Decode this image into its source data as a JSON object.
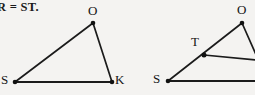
{
  "figure": {
    "background_color": "#f4f3f1",
    "stroke_color": "#1b1b1b",
    "text_color": "#141414",
    "caption": {
      "equation_fragment": "R = ST."
    },
    "left_triangle": {
      "name": "triangle-sok",
      "vertices": [
        {
          "label": "S",
          "x": 15,
          "y": 82,
          "label_x": 1,
          "label_y": 74
        },
        {
          "label": "O",
          "x": 93,
          "y": 23,
          "label_x": 89,
          "label_y": 6
        },
        {
          "label": "K",
          "x": 112,
          "y": 82,
          "label_x": 116,
          "label_y": 74
        }
      ],
      "edges": [
        {
          "name": "edge-s-o",
          "from": "S",
          "to": "O",
          "width": 1.7
        },
        {
          "name": "edge-o-k",
          "from": "O",
          "to": "K",
          "width": 1.7
        },
        {
          "name": "edge-s-k",
          "from": "S",
          "to": "K",
          "width": 2.2
        }
      ]
    },
    "right_figure": {
      "name": "figure-sto",
      "vertices": [
        {
          "label": "S",
          "x": 168,
          "y": 81,
          "label_x": 154,
          "label_y": 73
        },
        {
          "label": "T",
          "x": 204,
          "y": 55,
          "label_x": 192,
          "label_y": 36
        },
        {
          "label": "O",
          "x": 242,
          "y": 23,
          "label_x": 238,
          "label_y": 5
        },
        {
          "label": "",
          "x": 256,
          "y": 57,
          "label_x": 0,
          "label_y": 0
        }
      ],
      "edges": [
        {
          "name": "edge-s-t-o",
          "from": "S",
          "to": "O",
          "width": 1.7
        },
        {
          "name": "edge-o-right",
          "from": "O",
          "to": "R",
          "width": 1.7
        },
        {
          "name": "edge-t-right",
          "from": "T",
          "to": "R",
          "width": 1.7
        },
        {
          "name": "edge-s-baseline",
          "from": "S",
          "to": "RB",
          "width": 2.2
        }
      ]
    }
  }
}
